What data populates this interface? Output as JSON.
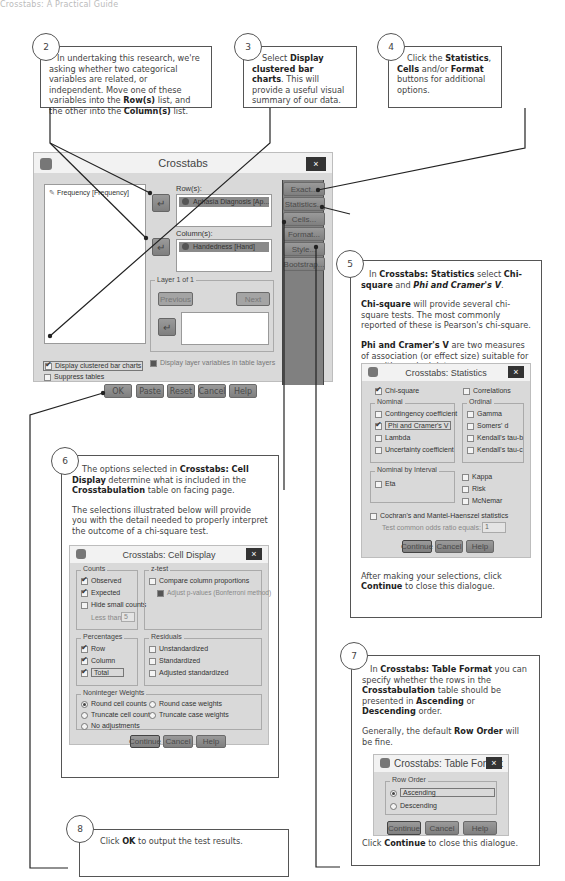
{
  "header": {
    "text": "Crosstabs: A Practical Guide"
  },
  "callouts": {
    "c2": {
      "number": "2",
      "parts": [
        "In undertaking this research, we're asking whether two categorical variables are related, or independent. Move one of these variables into the ",
        "Row(s)",
        " list, and the other into the ",
        "Column(s)",
        " list."
      ]
    },
    "c3": {
      "number": "3",
      "parts": [
        "Select ",
        "Display clustered bar charts",
        ". This will provide a useful visual summary of our data."
      ]
    },
    "c4": {
      "number": "4",
      "parts": [
        "Click the ",
        "Statistics",
        ", ",
        "Cells",
        " and/or ",
        "Format",
        " buttons for additional options."
      ]
    },
    "c5": {
      "number": "5",
      "p1": [
        "In ",
        "Crosstabs: Statistics",
        " select ",
        "Chi-square",
        " and ",
        "Phi and Cramer's V",
        "."
      ],
      "p2": [
        "Chi-square",
        " will provide several chi-square tests. The most commonly reported of these is Pearson's chi-square."
      ],
      "p3": [
        "Phi and Cramer's V",
        " are two measures of association (or effect size) suitable for use with nominal data."
      ],
      "p4": [
        "After making your selections, click ",
        "Continue",
        " to close this dialogue."
      ]
    },
    "c6": {
      "number": "6",
      "p1": [
        "The options selected in ",
        "Crosstabs: Cell Display",
        " determine what is included in the ",
        "Crosstabulation",
        " table on facing page."
      ],
      "p2": "The selections illustrated below will provide you with the detail needed to properly interpret the outcome of a chi-square test.",
      "p3": [
        "Click ",
        "Continue",
        " to close this dialogue."
      ]
    },
    "c7": {
      "number": "7",
      "p1": [
        "In ",
        "Crosstabs: Table Format",
        " you can specify whether the rows in the ",
        "Crosstabulation",
        " table should be presented in ",
        "Ascending",
        " or ",
        "Descending",
        " order."
      ],
      "p2": [
        "Generally, the default ",
        "Row Order",
        " will be fine."
      ],
      "p3": [
        "Click ",
        "Continue",
        " to close this dialogue."
      ]
    },
    "c8": {
      "number": "8",
      "parts": [
        "Click ",
        "OK",
        " to output the test results."
      ]
    }
  },
  "crosstabs": {
    "title": "Crosstabs",
    "close": "×",
    "source_list": [
      "Frequency [Frequency]"
    ],
    "rows_label": "Row(s):",
    "rows_value": "Aphasia Diagnosis [Ap...",
    "columns_label": "Column(s):",
    "columns_value": "Handedness [Hand]",
    "layer_label": "Layer 1 of 1",
    "previous": "Previous",
    "next": "Next",
    "side_buttons": [
      "Exact...",
      "Statistics...",
      "Cells...",
      "Format...",
      "Style...",
      "Bootstrap..."
    ],
    "display_layer": "Display layer variables in table layers",
    "display_bar": "Display clustered bar charts",
    "suppress": "Suppress tables",
    "bottom_buttons": [
      "OK",
      "Paste",
      "Reset",
      "Cancel",
      "Help"
    ]
  },
  "statistics": {
    "title": "Crosstabs: Statistics",
    "close": "×",
    "chi_square": "Chi-square",
    "correlations": "Correlations",
    "nominal_label": "Nominal",
    "nominal": [
      "Contingency coefficient",
      "Phi and Cramer's V",
      "Lambda",
      "Uncertainty coefficient"
    ],
    "ordinal_label": "Ordinal",
    "ordinal": [
      "Gamma",
      "Somers' d",
      "Kendall's tau-b",
      "Kendall's tau-c"
    ],
    "nbi_label": "Nominal by Interval",
    "eta": "Eta",
    "other": [
      "Kappa",
      "Risk",
      "McNemar"
    ],
    "cochran": "Cochran's and Mantel-Haenszel statistics",
    "odds_label": "Test common odds ratio equals:",
    "odds_value": "1",
    "buttons": [
      "Continue",
      "Cancel",
      "Help"
    ]
  },
  "cell_display": {
    "title": "Crosstabs: Cell Display",
    "close": "×",
    "counts_label": "Counts",
    "counts": [
      "Observed",
      "Expected",
      "Hide small counts"
    ],
    "less_than": "Less than",
    "less_value": "5",
    "ztest_label": "z-test",
    "compare": "Compare column proportions",
    "adjust": "Adjust p-values (Bonferroni method)",
    "pct_label": "Percentages",
    "pct": [
      "Row",
      "Column",
      "Total"
    ],
    "resid_label": "Residuals",
    "resid": [
      "Unstandardized",
      "Standardized",
      "Adjusted standardized"
    ],
    "weights_label": "Noninteger Weights",
    "weights": [
      "Round cell counts",
      "Round case weights",
      "Truncate cell counts",
      "Truncate case weights",
      "No adjustments"
    ],
    "buttons": [
      "Continue",
      "Cancel",
      "Help"
    ]
  },
  "table_format": {
    "title": "Crosstabs: Table Format",
    "close": "×",
    "row_order_label": "Row Order",
    "options": [
      "Ascending",
      "Descending"
    ],
    "buttons": [
      "Continue",
      "Cancel",
      "Help"
    ]
  }
}
